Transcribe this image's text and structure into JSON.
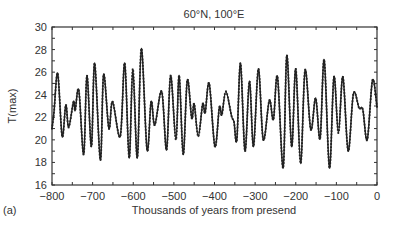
{
  "chart_data": {
    "type": "line",
    "title": "60°N,  100°E",
    "panel_label": "(a)",
    "xlabel": "Thousands of years from presend",
    "ylabel": "T(max)",
    "xlim": [
      -800,
      0
    ],
    "ylim": [
      16,
      30
    ],
    "xticks": [
      -800,
      -700,
      -600,
      -500,
      -400,
      -300,
      -200,
      -100,
      0
    ],
    "xtick_labels": [
      "−800",
      "−700",
      "−600",
      "−500",
      "−400",
      "−300",
      "−200",
      "−100",
      "0"
    ],
    "yticks": [
      16,
      18,
      20,
      22,
      24,
      26,
      28,
      30
    ],
    "ytick_labels": [
      "16",
      "18",
      "20",
      "22",
      "24",
      "26",
      "28",
      "30"
    ],
    "grid": false,
    "legend": null,
    "series": [
      {
        "name": "T(max)",
        "color": "#222222",
        "marker": "small-dot",
        "x": [
          -800,
          -795,
          -786,
          -775,
          -766,
          -759,
          -747,
          -743,
          -734,
          -722,
          -714,
          -703,
          -695,
          -681,
          -673,
          -660,
          -651,
          -632,
          -621,
          -610,
          -601,
          -590,
          -580,
          -566,
          -556,
          -547,
          -530,
          -518,
          -508,
          -495,
          -487,
          -477,
          -467,
          -456,
          -450,
          -440,
          -429,
          -423,
          -413,
          -399,
          -388,
          -382,
          -372,
          -358,
          -352,
          -345,
          -336,
          -325,
          -314,
          -304,
          -292,
          -280,
          -265,
          -255,
          -245,
          -231,
          -222,
          -210,
          -200,
          -188,
          -177,
          -163,
          -151,
          -140,
          -130,
          -117,
          -106,
          -95,
          -84,
          -71,
          -58,
          -44,
          -35,
          -24,
          -11,
          0
        ],
        "values": [
          21.0,
          22.5,
          25.9,
          20.3,
          23.1,
          21.1,
          23.4,
          22.6,
          24.4,
          18.7,
          25.7,
          19.4,
          26.8,
          18.2,
          25.8,
          21.0,
          23.4,
          20.3,
          26.8,
          18.4,
          26.3,
          18.4,
          28.1,
          19.1,
          23.4,
          21.3,
          24.3,
          19.1,
          25.7,
          20.0,
          25.7,
          18.7,
          25.3,
          21.9,
          23.2,
          20.3,
          23.2,
          22.4,
          25.0,
          19.4,
          22.9,
          22.2,
          24.3,
          22.1,
          21.6,
          20.0,
          26.8,
          19.0,
          25.2,
          19.4,
          26.3,
          20.0,
          23.5,
          21.8,
          25.6,
          17.5,
          27.5,
          19.4,
          26.3,
          17.9,
          26.2,
          20.9,
          23.7,
          20.1,
          27.1,
          17.5,
          25.6,
          20.6,
          25.6,
          19.0,
          24.1,
          22.8,
          22.7,
          20.0,
          25.3,
          22.9
        ]
      }
    ]
  }
}
